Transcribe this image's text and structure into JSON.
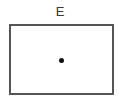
{
  "diagram": {
    "label": "E",
    "shape": "rectangle",
    "marker": "center-dot",
    "colors": {
      "label": "#3a3a3a",
      "border": "#555555",
      "dot": "#111111",
      "background": "#ffffff"
    }
  }
}
